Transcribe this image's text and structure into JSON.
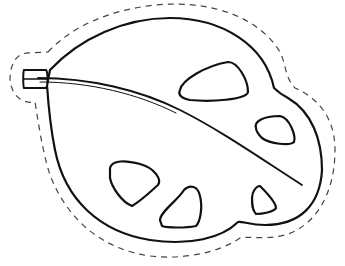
{
  "figure": {
    "subject": "leaf",
    "style": "line-art coloring cutout",
    "stroke_color": "#111111",
    "cut_line_color": "#444444",
    "background": "#ffffff",
    "hole_count": 6
  }
}
